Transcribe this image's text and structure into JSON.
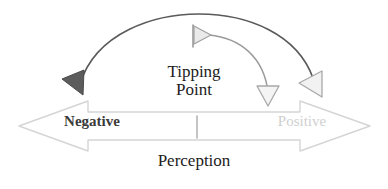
{
  "diagram": {
    "title_text": "Tipping Point",
    "tipping_point": {
      "line1": "Tipping",
      "line2": "Point"
    },
    "axis": {
      "left_label": "Negative",
      "right_label": "Positive",
      "bottom_label": "Perception"
    },
    "colors": {
      "background": "#ffffff",
      "outer_arc_stroke": "#5a5a5a",
      "inner_arc_stroke": "#9a9a9a",
      "left_arrowhead_fill": "#5c5c5c",
      "right_arrowhead_fill": "#f2f2f2",
      "right_arrowhead_stroke": "#a8a8a8",
      "down_arrowhead_fill": "#f4f4f4",
      "down_arrowhead_stroke": "#a8a8a8",
      "pennant_fill": "#eaeaea",
      "pennant_stroke": "#a0a0a0",
      "block_arrow_stroke": "#d5d5d5",
      "block_arrow_fill": "#ffffff",
      "tick_stroke": "#b0b0b0",
      "negative_text": "#3b3b3b",
      "positive_text": "#cfcfcf",
      "body_text": "#1c1c1c"
    },
    "icons": {
      "outer_arc": "curved-arrow-right-to-left",
      "inner_arc": "curved-arrow-down",
      "pennant": "flag-marker-icon",
      "left_head": "triangle-left-filled-icon",
      "right_head": "triangle-left-outline-icon",
      "down_head": "triangle-down-outline-icon",
      "block_arrow": "double-headed-arrow-icon",
      "center_tick": "tick-mark-icon"
    }
  }
}
